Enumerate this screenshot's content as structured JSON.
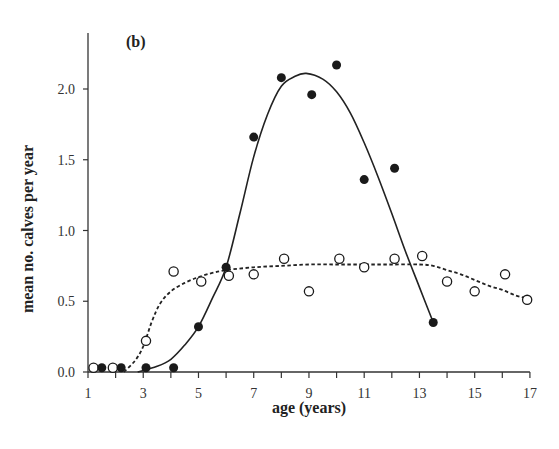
{
  "panel_label": "(b)",
  "chart_data": {
    "type": "scatter",
    "title": "",
    "panel": "(b)",
    "xlabel": "age (years)",
    "ylabel": "mean no. calves per year",
    "xlim": [
      1,
      17
    ],
    "ylim": [
      0,
      2.4
    ],
    "xticks": [
      1,
      3,
      5,
      7,
      9,
      11,
      13,
      15,
      17
    ],
    "xtick_labels": [
      "1",
      "3",
      "5",
      "7",
      "9",
      "11",
      "13",
      "15",
      "17"
    ],
    "xminor_ticks": [
      2,
      4,
      6,
      8,
      10,
      12,
      14,
      16
    ],
    "yticks": [
      0.0,
      0.5,
      1.0,
      1.5,
      2.0
    ],
    "ytick_labels": [
      "0.0",
      "0.5",
      "1.0",
      "1.5",
      "2.0"
    ],
    "grid": false,
    "legend": null,
    "series": [
      {
        "name": "filled",
        "marker": "filled-circle",
        "color": "#1a1a1a",
        "points": [
          [
            1.5,
            0.03
          ],
          [
            2.2,
            0.03
          ],
          [
            3.1,
            0.03
          ],
          [
            4.1,
            0.03
          ],
          [
            5.0,
            0.32
          ],
          [
            6.0,
            0.74
          ],
          [
            7.0,
            1.66
          ],
          [
            8.0,
            2.08
          ],
          [
            9.1,
            1.96
          ],
          [
            10.0,
            2.17
          ],
          [
            11.0,
            1.36
          ],
          [
            12.1,
            1.44
          ],
          [
            13.5,
            0.35
          ]
        ],
        "fit_line": {
          "style": "solid",
          "points": [
            [
              2.8,
              0.0
            ],
            [
              3.5,
              0.04
            ],
            [
              4.0,
              0.09
            ],
            [
              4.5,
              0.19
            ],
            [
              5.0,
              0.32
            ],
            [
              5.5,
              0.52
            ],
            [
              6.0,
              0.74
            ],
            [
              6.5,
              1.12
            ],
            [
              7.0,
              1.52
            ],
            [
              7.5,
              1.82
            ],
            [
              8.0,
              2.02
            ],
            [
              8.5,
              2.09
            ],
            [
              8.9,
              2.11
            ],
            [
              9.5,
              2.07
            ],
            [
              10.0,
              1.98
            ],
            [
              10.5,
              1.83
            ],
            [
              11.0,
              1.62
            ],
            [
              11.5,
              1.38
            ],
            [
              12.0,
              1.12
            ],
            [
              12.5,
              0.85
            ],
            [
              13.0,
              0.6
            ],
            [
              13.5,
              0.35
            ]
          ]
        }
      },
      {
        "name": "open",
        "marker": "open-circle",
        "color": "#1a1a1a",
        "points": [
          [
            1.2,
            0.03
          ],
          [
            1.9,
            0.03
          ],
          [
            3.1,
            0.22
          ],
          [
            4.1,
            0.71
          ],
          [
            5.1,
            0.64
          ],
          [
            6.1,
            0.68
          ],
          [
            7.0,
            0.69
          ],
          [
            8.1,
            0.8
          ],
          [
            9.0,
            0.57
          ],
          [
            10.1,
            0.8
          ],
          [
            11.0,
            0.74
          ],
          [
            12.1,
            0.8
          ],
          [
            13.1,
            0.82
          ],
          [
            14.0,
            0.64
          ],
          [
            15.0,
            0.57
          ],
          [
            16.1,
            0.69
          ],
          [
            16.9,
            0.51
          ]
        ],
        "fit_line": {
          "style": "dashed",
          "points": [
            [
              2.3,
              0.0
            ],
            [
              2.7,
              0.08
            ],
            [
              3.0,
              0.18
            ],
            [
              3.3,
              0.35
            ],
            [
              3.6,
              0.48
            ],
            [
              4.0,
              0.57
            ],
            [
              4.5,
              0.63
            ],
            [
              5.0,
              0.67
            ],
            [
              5.5,
              0.7
            ],
            [
              6.0,
              0.72
            ],
            [
              7.0,
              0.74
            ],
            [
              8.0,
              0.75
            ],
            [
              9.0,
              0.76
            ],
            [
              10.0,
              0.76
            ],
            [
              11.0,
              0.76
            ],
            [
              12.0,
              0.76
            ],
            [
              13.0,
              0.76
            ],
            [
              13.5,
              0.75
            ],
            [
              14.0,
              0.72
            ],
            [
              14.5,
              0.69
            ],
            [
              15.0,
              0.65
            ],
            [
              15.5,
              0.61
            ],
            [
              16.0,
              0.58
            ],
            [
              16.5,
              0.54
            ],
            [
              16.9,
              0.52
            ]
          ]
        }
      }
    ]
  }
}
